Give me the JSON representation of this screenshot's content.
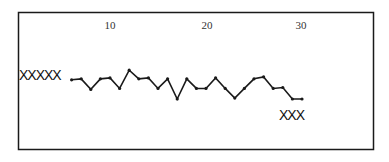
{
  "chart_data": {
    "type": "line",
    "title": "",
    "xlabel": "",
    "ylabel": "",
    "x_ticks": [
      10,
      20,
      30
    ],
    "x": [
      6,
      7,
      8,
      9,
      10,
      11,
      12,
      13,
      14,
      15,
      16,
      17,
      18,
      19,
      20,
      21,
      22,
      23,
      24,
      25,
      26,
      27,
      28,
      29,
      30
    ],
    "values": [
      2.0,
      2.1,
      1.0,
      2.1,
      2.2,
      1.1,
      3.0,
      2.1,
      2.2,
      1.1,
      2.1,
      0.0,
      2.1,
      1.1,
      1.1,
      2.2,
      1.1,
      0.1,
      1.1,
      2.1,
      2.3,
      1.1,
      1.2,
      0.0,
      0.0
    ],
    "ylim": [
      -3,
      6
    ],
    "xlim": [
      1,
      36
    ],
    "grid": false,
    "legend": null,
    "annotations": [
      {
        "text": "XXXXX",
        "position": "left, at series level before x=6"
      },
      {
        "text": "XXX",
        "position": "below series end near x=28-30"
      }
    ]
  },
  "labels": {
    "tick_10": "10",
    "tick_20": "20",
    "tick_30": "30",
    "left_marks": "XXXXX",
    "right_marks": "XXX"
  },
  "colors": {
    "line": "#1a1a1a",
    "frame": "#1a1a1a",
    "background": "#ffffff"
  }
}
